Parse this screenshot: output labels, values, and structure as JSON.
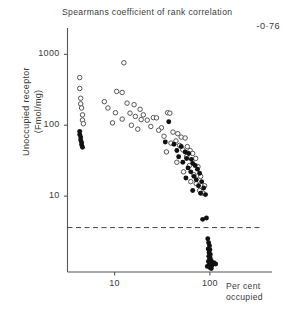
{
  "chart_data": {
    "type": "scatter",
    "title": "Spearmans coefficient of rank correlation",
    "annotation": "-0·76",
    "xlabel_line1": "Per cent",
    "xlabel_line2": "occupied",
    "ylabel_line1": "Unoccupied receptor",
    "ylabel_line2": "(Fmol/mg)",
    "xscale": "log",
    "yscale": "log",
    "xlim": [
      3.2,
      320
    ],
    "ylim": [
      0.85,
      2000
    ],
    "xticks": [
      10,
      100
    ],
    "xtick_labels": [
      "10",
      "100"
    ],
    "yticks": [
      10,
      100,
      1000
    ],
    "ytick_labels": [
      "10",
      "100",
      "1000"
    ],
    "grid": false,
    "legend": "none",
    "reference_line": {
      "type": "horizontal-dashed",
      "y": 3.6,
      "label": ""
    },
    "series": [
      {
        "name": "open",
        "marker": "open-circle",
        "color": "#555555",
        "points": [
          [
            4.3,
            470
          ],
          [
            4.3,
            330
          ],
          [
            4.4,
            240
          ],
          [
            4.4,
            200
          ],
          [
            4.5,
            175
          ],
          [
            4.6,
            140
          ],
          [
            4.6,
            118
          ],
          [
            4.7,
            105
          ],
          [
            12.5,
            760
          ],
          [
            10.5,
            300
          ],
          [
            12.0,
            290
          ],
          [
            7.8,
            215
          ],
          [
            13.5,
            205
          ],
          [
            16.0,
            195
          ],
          [
            8.5,
            175
          ],
          [
            18.5,
            168
          ],
          [
            10.2,
            150
          ],
          [
            14.5,
            148
          ],
          [
            20.0,
            140
          ],
          [
            16.5,
            133
          ],
          [
            25.5,
            128
          ],
          [
            27.5,
            127
          ],
          [
            12.0,
            122
          ],
          [
            19.0,
            120
          ],
          [
            22.0,
            118
          ],
          [
            9.5,
            108
          ],
          [
            15.0,
            100
          ],
          [
            24.0,
            96
          ],
          [
            31.0,
            92
          ],
          [
            17.5,
            88
          ],
          [
            36.0,
            150
          ],
          [
            38.0,
            148
          ],
          [
            29.0,
            85
          ],
          [
            41.0,
            80
          ],
          [
            46.0,
            76
          ],
          [
            33.0,
            70
          ],
          [
            50.0,
            68
          ],
          [
            55.0,
            66
          ],
          [
            44.0,
            60
          ],
          [
            39.0,
            56
          ],
          [
            48.0,
            52
          ],
          [
            58.0,
            50
          ],
          [
            52.0,
            45
          ],
          [
            62.0,
            44
          ],
          [
            35.0,
            42
          ],
          [
            66.0,
            40
          ],
          [
            57.0,
            36
          ],
          [
            71.0,
            34
          ],
          [
            45.0,
            30
          ],
          [
            61.0,
            27
          ],
          [
            75.0,
            26
          ],
          [
            53.0,
            22
          ],
          [
            68.0,
            20
          ],
          [
            80.0,
            19
          ],
          [
            63.0,
            16
          ],
          [
            72.0,
            15
          ],
          [
            88.0,
            14
          ],
          [
            78.0,
            12
          ],
          [
            85.0,
            11
          ]
        ]
      },
      {
        "name": "filled",
        "marker": "filled-circle",
        "color": "#111111",
        "points": [
          [
            4.3,
            82
          ],
          [
            4.3,
            74
          ],
          [
            4.4,
            68
          ],
          [
            4.4,
            62
          ],
          [
            4.5,
            57
          ],
          [
            4.5,
            53
          ],
          [
            4.6,
            49
          ],
          [
            37.0,
            112
          ],
          [
            34.0,
            58
          ],
          [
            42.0,
            54
          ],
          [
            50.0,
            50
          ],
          [
            45.0,
            44
          ],
          [
            55.0,
            42
          ],
          [
            60.0,
            40
          ],
          [
            47.0,
            36
          ],
          [
            57.0,
            34
          ],
          [
            64.0,
            33
          ],
          [
            52.0,
            30
          ],
          [
            66.0,
            29
          ],
          [
            70.0,
            27
          ],
          [
            59.0,
            25
          ],
          [
            74.0,
            24
          ],
          [
            63.0,
            22
          ],
          [
            78.0,
            21
          ],
          [
            68.0,
            19
          ],
          [
            56.0,
            18
          ],
          [
            72.0,
            17
          ],
          [
            82.0,
            16
          ],
          [
            76.0,
            14
          ],
          [
            86.0,
            13
          ],
          [
            66.0,
            12
          ],
          [
            80.0,
            11
          ],
          [
            90.0,
            10.5
          ],
          [
            84.0,
            4.7
          ],
          [
            92.0,
            4.9
          ],
          [
            95.0,
            2.5
          ],
          [
            97.0,
            2.2
          ],
          [
            99.0,
            2.0
          ],
          [
            96.0,
            1.8
          ],
          [
            100.0,
            1.75
          ],
          [
            98.0,
            1.6
          ],
          [
            101.0,
            1.5
          ],
          [
            97.5,
            1.42
          ],
          [
            100.5,
            1.35
          ],
          [
            99.0,
            1.28
          ],
          [
            103.0,
            1.24
          ],
          [
            96.5,
            1.2
          ],
          [
            101.5,
            1.14
          ],
          [
            98.5,
            1.08
          ],
          [
            105.0,
            1.05
          ],
          [
            110.0,
            1.15
          ],
          [
            115.0,
            1.1
          ],
          [
            94.0,
            1.02
          ],
          [
            100.0,
            0.98
          ],
          [
            103.5,
            0.95
          ]
        ]
      }
    ]
  }
}
